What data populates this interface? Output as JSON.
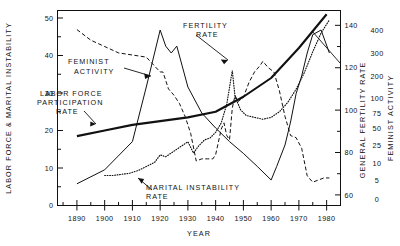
{
  "chart_data": {
    "type": "line",
    "title": "",
    "xlabel": "YEAR",
    "xlim": [
      1883,
      1985
    ],
    "xticks": [
      1890,
      1900,
      1910,
      1920,
      1930,
      1940,
      1950,
      1960,
      1970,
      1980
    ],
    "xticklabels": [
      "1890",
      "1900",
      "1910",
      "1920",
      "1930",
      "1940",
      "1950",
      "1960",
      "1970",
      "1980"
    ],
    "grid": false,
    "legend_position": "inline-annotations",
    "axes": [
      {
        "id": "left",
        "label": "LABOR FORCE & MARITAL INSTABILITY",
        "side": "left",
        "lim": [
          0,
          52
        ],
        "ticks": [
          0,
          10,
          20,
          30,
          40,
          50
        ],
        "ticklabels": [
          "0",
          "10",
          "20",
          "30",
          "40",
          "50"
        ],
        "minor_ticks": [
          5,
          15,
          25,
          35,
          45
        ]
      },
      {
        "id": "fertility",
        "label": "GENERAL FERTILITY RATE",
        "side": "right",
        "lim": [
          55,
          147
        ],
        "ticks": [
          60,
          80,
          100,
          120,
          140
        ],
        "ticklabels": [
          "60",
          "80",
          "100",
          "120",
          "140"
        ],
        "minor_ticks": [
          70,
          90,
          110,
          130
        ]
      },
      {
        "id": "feminist",
        "label": "FEMINIST ACTIVITY",
        "side": "right-outer",
        "scale": "log-like",
        "ticks": [
          0,
          5,
          10,
          25,
          50,
          75,
          100,
          200,
          300,
          400
        ],
        "ticklabels": [
          "0",
          "5",
          "10",
          "25",
          "50",
          "75",
          "100",
          "200",
          "300",
          "400"
        ]
      }
    ],
    "annotations": [
      {
        "text": "FERTILITY RATE",
        "target_series": "fertility-rate"
      },
      {
        "text": "FEMINIST ACTIVITY",
        "target_series": "feminist-activity"
      },
      {
        "text": "LABOR FORCE PARTICIPATION RATE",
        "target_series": "labor-force-participation-rate"
      },
      {
        "text": "MARITAL INSTABILITY RATE",
        "target_series": "marital-instability-rate"
      }
    ],
    "series": [
      {
        "name": "FERTILITY RATE",
        "axis": "fertility",
        "style": "dashed",
        "x": [
          1890,
          1895,
          1900,
          1905,
          1910,
          1915,
          1920,
          1921,
          1923,
          1925,
          1927,
          1929,
          1931,
          1933,
          1935,
          1937,
          1939,
          1940,
          1942,
          1943,
          1944,
          1945,
          1946,
          1947,
          1948,
          1950,
          1952,
          1954,
          1956,
          1957,
          1959,
          1961,
          1963,
          1965,
          1967,
          1969,
          1971,
          1973,
          1975,
          1977,
          1979,
          1981
        ],
        "values": [
          138,
          133,
          130,
          127,
          126,
          125,
          118,
          118,
          110,
          107,
          103,
          97,
          89,
          76,
          77,
          77,
          77,
          79,
          91,
          94,
          88,
          86,
          101,
          107,
          104,
          106,
          113,
          118,
          121,
          123,
          120,
          118,
          109,
          97,
          88,
          87,
          82,
          69,
          66,
          67,
          68,
          68
        ]
      },
      {
        "name": "FEMINIST ACTIVITY",
        "axis": "feminist",
        "style": "solid",
        "x": [
          1890,
          1900,
          1910,
          1915,
          1920,
          1922,
          1924,
          1926,
          1930,
          1935,
          1940,
          1945,
          1950,
          1955,
          1960,
          1962,
          1965,
          1967,
          1969,
          1971,
          1973,
          1975,
          1978,
          1981
        ],
        "values": [
          4,
          8,
          30,
          150,
          400,
          330,
          300,
          330,
          150,
          75,
          50,
          30,
          18,
          9,
          5,
          9,
          25,
          60,
          120,
          200,
          300,
          380,
          400,
          300
        ]
      },
      {
        "name": "LABOR FORCE PARTICIPATION RATE",
        "axis": "left",
        "style": "thick-solid",
        "x": [
          1890,
          1900,
          1910,
          1920,
          1930,
          1940,
          1950,
          1960,
          1970,
          1980
        ],
        "values": [
          18.5,
          20.0,
          21.5,
          22.5,
          23.5,
          25.0,
          29.0,
          34.0,
          42.0,
          51.0
        ]
      },
      {
        "name": "MARITAL INSTABILITY RATE",
        "axis": "left",
        "style": "dotted",
        "x": [
          1900,
          1903,
          1906,
          1909,
          1912,
          1915,
          1918,
          1920,
          1922,
          1925,
          1928,
          1930,
          1932,
          1934,
          1936,
          1938,
          1940,
          1942,
          1944,
          1946,
          1947,
          1949,
          1951,
          1954,
          1957,
          1960,
          1963,
          1966,
          1969,
          1972,
          1975,
          1978,
          1981
        ],
        "values": [
          8.0,
          8.0,
          8.3,
          8.6,
          9.3,
          10.4,
          11.5,
          13.5,
          13.0,
          14.5,
          16.0,
          17.0,
          14.0,
          16.0,
          17.5,
          18.0,
          19.5,
          22.0,
          27.0,
          36.0,
          29.0,
          25.5,
          24.0,
          23.5,
          23.0,
          23.5,
          25.0,
          27.5,
          31.0,
          35.5,
          41.0,
          46.0,
          49.5
        ]
      }
    ]
  },
  "annotations_text": {
    "fertility_line1": "FERTILITY",
    "fertility_line2": "RATE",
    "feminist_line1": "FEMINIST",
    "feminist_line2": "ACTIVITY",
    "labor_line1": "LABOR FORCE",
    "labor_line2": "PARTICIPATION",
    "labor_line3": "RATE",
    "marital_line1": "MARITAL INSTABILITY",
    "marital_line2": "RATE"
  },
  "axis_titles": {
    "left": "LABOR FORCE & MARITAL INSTABILITY",
    "x": "YEAR",
    "right_inner": "GENERAL FERTILITY RATE",
    "right_outer": "FEMINIST ACTIVITY"
  },
  "tick_labels": {
    "left": [
      "50",
      "40",
      "30",
      "20",
      "10",
      "0"
    ],
    "x": [
      "1890",
      "1900",
      "1910",
      "1920",
      "1930",
      "1940",
      "1950",
      "1960",
      "1970",
      "1980"
    ],
    "fertility": [
      "140",
      "120",
      "100",
      "80",
      "60"
    ],
    "feminist": [
      "400",
      "300",
      "200",
      "100",
      "75",
      "50",
      "25",
      "10",
      "5",
      "0"
    ]
  },
  "colors": {
    "ink": "#111111",
    "background": "#ffffff"
  }
}
